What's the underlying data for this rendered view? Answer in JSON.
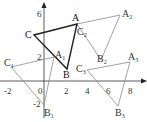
{
  "diagram": {
    "type": "coordinate-plane-triangles",
    "axes": {
      "x_ticks": [
        "-2",
        "0",
        "2",
        "4",
        "6",
        "8"
      ],
      "y_ticks": [
        "6",
        "2",
        "-2"
      ],
      "origin_label": "0"
    },
    "triangles": [
      {
        "name": "ABC",
        "style": "bold",
        "color": "#222222",
        "vertices": [
          {
            "label": "A",
            "x": 3,
            "y": 5
          },
          {
            "label": "B",
            "x": 2,
            "y": 1
          },
          {
            "label": "C",
            "x": -1,
            "y": 4
          }
        ]
      },
      {
        "name": "A1B1C1",
        "style": "thin",
        "color": "#888888",
        "vertices": [
          {
            "label": "A",
            "sub": "1",
            "x": 1,
            "y": 2
          },
          {
            "label": "B",
            "sub": "1",
            "x": 0,
            "y": -2
          },
          {
            "label": "C",
            "sub": "1",
            "x": -3,
            "y": 1
          }
        ]
      },
      {
        "name": "A2B2C2",
        "style": "thin",
        "color": "#888888",
        "vertices": [
          {
            "label": "A",
            "sub": "2",
            "x": 7,
            "y": 6
          },
          {
            "label": "B",
            "sub": "2",
            "x": 5,
            "y": 2
          },
          {
            "label": "C",
            "sub": "2",
            "x": 3,
            "y": 5
          }
        ]
      },
      {
        "name": "A3B3C3",
        "style": "thin",
        "color": "#888888",
        "vertices": [
          {
            "label": "A",
            "sub": "3",
            "x": 8,
            "y": 2
          },
          {
            "label": "B",
            "sub": "3",
            "x": 7,
            "y": -2
          },
          {
            "label": "C",
            "sub": "3",
            "x": 4,
            "y": 1
          }
        ]
      }
    ]
  }
}
